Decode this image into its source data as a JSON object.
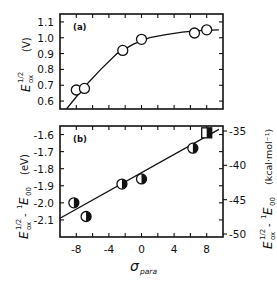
{
  "chart_data": [
    {
      "type": "scatter",
      "panel_label": "(a)",
      "title": "",
      "xlabel": "σpara",
      "ylabel": "E_ox^1/2 (V)",
      "ylabel_main": "E",
      "ylabel_sup": "1/2",
      "ylabel_sub": "ox",
      "ylabel_unit": "(V)",
      "xlim": [
        -10,
        10
      ],
      "ylim": [
        0.55,
        1.15
      ],
      "y_ticks": [
        "0.6",
        "0.7",
        "0.8",
        "0.9",
        "1.0",
        "1.1"
      ],
      "y_tick_values": [
        0.6,
        0.7,
        0.8,
        0.9,
        1.0,
        1.1
      ],
      "marker": "open circle",
      "fit": "curve",
      "x": [
        -8,
        -7,
        -2.3,
        0,
        6.5,
        8
      ],
      "y": [
        0.67,
        0.68,
        0.92,
        0.99,
        1.03,
        1.05
      ],
      "fit_curve": [
        [
          -9.2,
          0.55
        ],
        [
          -7,
          0.69
        ],
        [
          -5,
          0.8
        ],
        [
          -3,
          0.9
        ],
        [
          -1,
          0.96
        ],
        [
          1,
          1.0
        ],
        [
          3,
          1.02
        ],
        [
          5,
          1.035
        ],
        [
          7,
          1.045
        ],
        [
          9.5,
          1.05
        ]
      ]
    },
    {
      "type": "scatter",
      "panel_label": "(b)",
      "title": "",
      "xlabel": "σpara",
      "xlabel_main": "σ",
      "xlabel_sub": "para",
      "ylabel": "E_ox^1/2 - 1E00 (eV)",
      "ylabel_right": "E_ox^1/2 - 1E00 (kcal·mol⁻¹)",
      "ylabel_unit": "(eV)",
      "ylabel_right_unit": "(kcal·mol⁻¹)",
      "xlim": [
        -10,
        10
      ],
      "ylim": [
        -2.2,
        -1.55
      ],
      "x_ticks": [
        "-8",
        "-4",
        "0",
        "4",
        "8"
      ],
      "x_tick_values": [
        -8,
        -4,
        0,
        4,
        8
      ],
      "y_ticks": [
        "-1.6",
        "-1.7",
        "-1.8",
        "-1.9",
        "-2.0",
        "-2.1"
      ],
      "y_tick_values": [
        -1.6,
        -1.7,
        -1.8,
        -1.9,
        -2.0,
        -2.1
      ],
      "y2_ticks": [
        "-35",
        "-40",
        "-45",
        "-50"
      ],
      "y2_tick_values": [
        -35,
        -40,
        -45,
        -50
      ],
      "marker": "half-filled circle (last point half-filled square)",
      "fit": "linear",
      "x": [
        -8.3,
        -6.8,
        -2.4,
        0,
        6.3,
        8
      ],
      "y": [
        -2.0,
        -2.08,
        -1.89,
        -1.86,
        -1.68,
        -1.59
      ],
      "fit_line": [
        [
          -10,
          -2.09
        ],
        [
          9.5,
          -1.57
        ]
      ]
    }
  ]
}
